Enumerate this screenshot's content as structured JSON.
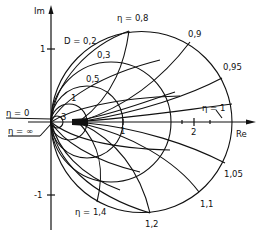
{
  "diagram": {
    "type": "complex-plane locus diagram",
    "axes": {
      "x_label": "Re",
      "y_label": "Im",
      "x_ticks": [
        {
          "value": 1,
          "label": "1"
        },
        {
          "value": 2,
          "label": "2"
        }
      ],
      "y_ticks": [
        {
          "value": 1,
          "label": "1"
        },
        {
          "value": -1,
          "label": "-1"
        }
      ]
    },
    "d_circles": {
      "prefix": "D = ",
      "labels": [
        "0,2",
        "0,3",
        "0,5",
        "1",
        "3"
      ],
      "first_label": "D = 0,2"
    },
    "eta_curves": {
      "labels": {
        "eta_0": "η = 0",
        "eta_inf": "η = ∞",
        "eta_08": "η = 0,8",
        "eta_09": "0,9",
        "eta_095": "0,95",
        "eta_1": "η = 1",
        "eta_105": "1,05",
        "eta_11": "1,1",
        "eta_12": "1,2",
        "eta_14": "η = 1,4"
      }
    },
    "colors": {
      "line": "#111111",
      "background": "#ffffff"
    }
  }
}
